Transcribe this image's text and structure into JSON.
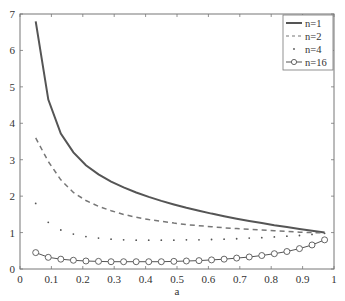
{
  "chart_data": {
    "type": "line",
    "title": "",
    "xlabel": "a",
    "ylabel": "",
    "xlim": [
      0,
      1
    ],
    "ylim": [
      0,
      7
    ],
    "xticks": [
      "0",
      "0.1",
      "0.2",
      "0.3",
      "0.4",
      "0.5",
      "0.6",
      "0.7",
      "0.8",
      "0.9",
      "1"
    ],
    "yticks": [
      "0",
      "1",
      "2",
      "3",
      "4",
      "5",
      "6",
      "7"
    ],
    "grid": false,
    "legend_position": "upper right",
    "x": [
      0.05,
      0.09,
      0.13,
      0.17,
      0.21,
      0.25,
      0.29,
      0.33,
      0.37,
      0.41,
      0.45,
      0.49,
      0.53,
      0.57,
      0.61,
      0.65,
      0.69,
      0.73,
      0.77,
      0.81,
      0.85,
      0.89,
      0.93,
      0.97
    ],
    "series": [
      {
        "name": "n=1",
        "style": "solid",
        "values": [
          6.8,
          4.65,
          3.72,
          3.2,
          2.85,
          2.6,
          2.4,
          2.24,
          2.1,
          1.98,
          1.87,
          1.77,
          1.68,
          1.6,
          1.52,
          1.45,
          1.38,
          1.32,
          1.26,
          1.2,
          1.15,
          1.1,
          1.05,
          1.0
        ]
      },
      {
        "name": "n=2",
        "style": "dashed",
        "values": [
          3.6,
          2.95,
          2.45,
          2.1,
          1.88,
          1.72,
          1.6,
          1.5,
          1.42,
          1.36,
          1.31,
          1.26,
          1.22,
          1.19,
          1.16,
          1.13,
          1.11,
          1.09,
          1.07,
          1.05,
          1.03,
          1.01,
          1.0,
          0.99
        ]
      },
      {
        "name": "n=4",
        "style": "dots",
        "values": [
          1.8,
          1.28,
          1.07,
          0.96,
          0.89,
          0.85,
          0.82,
          0.8,
          0.79,
          0.79,
          0.79,
          0.79,
          0.8,
          0.8,
          0.81,
          0.82,
          0.83,
          0.85,
          0.86,
          0.88,
          0.9,
          0.92,
          0.95,
          0.98
        ]
      },
      {
        "name": "n=16",
        "style": "line-circle",
        "values": [
          0.45,
          0.32,
          0.27,
          0.24,
          0.22,
          0.21,
          0.2,
          0.2,
          0.2,
          0.2,
          0.2,
          0.21,
          0.22,
          0.23,
          0.25,
          0.27,
          0.3,
          0.33,
          0.37,
          0.42,
          0.48,
          0.56,
          0.66,
          0.8
        ]
      }
    ],
    "colors": {
      "line": "#555555",
      "axis": "#666666",
      "text": "#333333"
    }
  }
}
